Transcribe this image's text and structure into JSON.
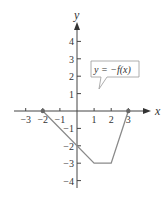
{
  "chart_data": {
    "type": "line",
    "title": "",
    "xlabel": "x",
    "ylabel": "y",
    "xlim": [
      -3,
      3
    ],
    "ylim": [
      -4,
      4
    ],
    "x_ticks": [
      -3,
      -2,
      -1,
      1,
      2,
      3
    ],
    "y_ticks": [
      -4,
      -3,
      -2,
      -1,
      1,
      2,
      3,
      4
    ],
    "x_tick_labels": [
      "−3",
      "−2",
      "−1",
      "1",
      "2",
      "3"
    ],
    "y_tick_labels": [
      "−4",
      "−3",
      "−2",
      "−1",
      "1",
      "2",
      "3",
      "4"
    ],
    "grid": false,
    "series": [
      {
        "name": "y = −f(x)",
        "points": [
          [
            -2,
            0
          ],
          [
            1,
            -3
          ],
          [
            2,
            -3
          ],
          [
            3,
            0
          ]
        ],
        "endpoints_marked": [
          [
            -2,
            0
          ],
          [
            3,
            0
          ]
        ],
        "color": "#888888"
      }
    ],
    "annotations": [
      {
        "text": "y = −f(x)",
        "type": "callout",
        "points_to": [
          1.3,
          1
        ]
      }
    ]
  },
  "labels": {
    "x_axis": "x",
    "y_axis": "y",
    "callout": "y = −f(x)"
  }
}
